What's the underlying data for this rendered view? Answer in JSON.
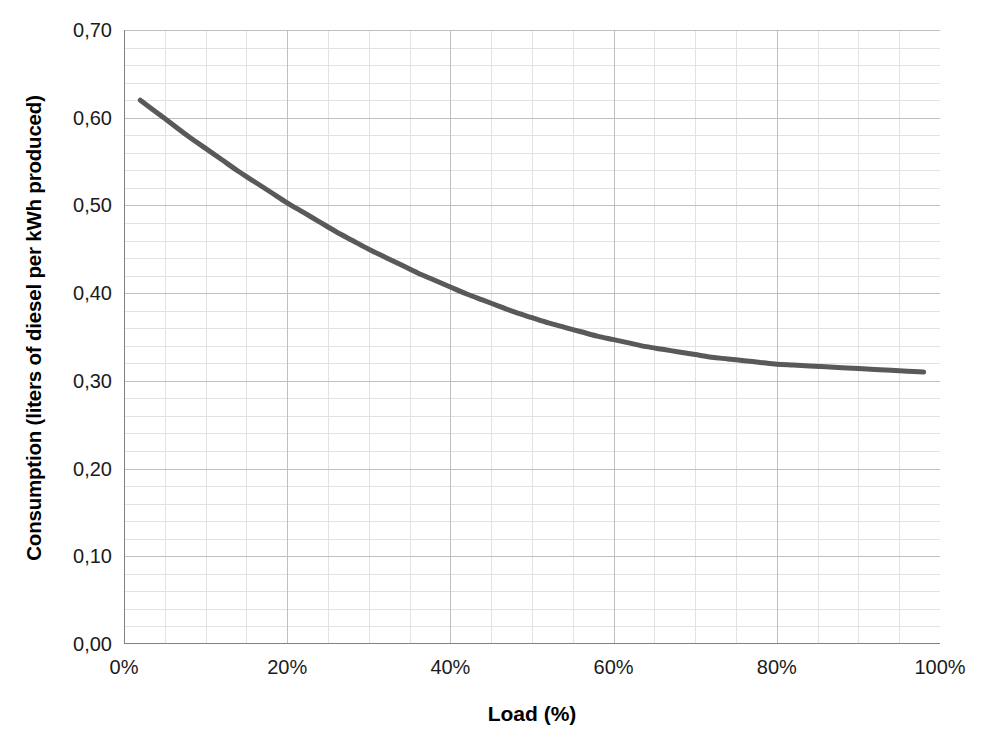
{
  "chart_data": {
    "type": "line",
    "title": "",
    "xlabel": "Load (%)",
    "ylabel": "Consumption (liters of diesel per kWh produced)",
    "xlim": [
      0,
      100
    ],
    "ylim": [
      0,
      0.7
    ],
    "grid": true,
    "legend": "none",
    "decimal_separator": ",",
    "x_tick_labels": [
      "0%",
      "20%",
      "40%",
      "60%",
      "80%",
      "100%"
    ],
    "x_tick_values": [
      0,
      20,
      40,
      60,
      80,
      100
    ],
    "y_tick_labels": [
      "0,00",
      "0,10",
      "0,20",
      "0,30",
      "0,40",
      "0,50",
      "0,60",
      "0,70"
    ],
    "y_tick_values": [
      0.0,
      0.1,
      0.2,
      0.3,
      0.4,
      0.5,
      0.6,
      0.7
    ],
    "x_minor_step": 5,
    "y_minor_step": 0.02,
    "series": [
      {
        "name": "Specific diesel consumption",
        "color": "#595959",
        "line_width": 5,
        "x": [
          2,
          4,
          6,
          8,
          10,
          12,
          14,
          16,
          18,
          20,
          22,
          24,
          26,
          28,
          30,
          32,
          34,
          36,
          38,
          40,
          42,
          44,
          46,
          48,
          50,
          52,
          54,
          56,
          58,
          60,
          62,
          64,
          66,
          68,
          70,
          72,
          74,
          76,
          78,
          80,
          82,
          84,
          86,
          88,
          90,
          92,
          94,
          96,
          98
        ],
        "values": [
          0.62,
          0.606,
          0.592,
          0.578,
          0.565,
          0.552,
          0.539,
          0.527,
          0.515,
          0.503,
          0.492,
          0.481,
          0.47,
          0.46,
          0.45,
          0.441,
          0.432,
          0.423,
          0.415,
          0.407,
          0.399,
          0.392,
          0.385,
          0.378,
          0.372,
          0.366,
          0.361,
          0.356,
          0.351,
          0.347,
          0.343,
          0.339,
          0.336,
          0.333,
          0.33,
          0.327,
          0.325,
          0.323,
          0.321,
          0.319,
          0.318,
          0.317,
          0.316,
          0.315,
          0.314,
          0.313,
          0.312,
          0.311,
          0.31
        ]
      }
    ],
    "annotations": []
  },
  "style": {
    "background": "#ffffff",
    "major_grid_color": "#bfbfbf",
    "minor_grid_color": "#e2e2e2",
    "axis_color": "#808080",
    "text_color": "#1a1a1a"
  }
}
